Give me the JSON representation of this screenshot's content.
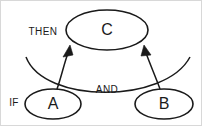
{
  "diagram": {
    "type": "rule-inference-diagram",
    "background_color": "#ffffff",
    "stroke_color": "#1a1a1a",
    "text_color": "#1a1a1a",
    "nodes": [
      {
        "id": "A",
        "label": "A",
        "cx": 53,
        "cy": 104,
        "rx": 28,
        "ry": 15
      },
      {
        "id": "B",
        "label": "B",
        "cx": 164,
        "cy": 104,
        "rx": 29,
        "ry": 15
      },
      {
        "id": "C",
        "label": "C",
        "cx": 107,
        "cy": 30,
        "rx": 42,
        "ry": 20
      }
    ],
    "edges": [
      {
        "id": "a-to-c",
        "from": "A",
        "to": "C",
        "arrow": true
      },
      {
        "id": "b-to-c",
        "from": "B",
        "to": "C",
        "arrow": true
      }
    ],
    "labels": [
      {
        "id": "if-label",
        "text": "IF",
        "x": 14,
        "y": 103
      },
      {
        "id": "then-label",
        "text": "THEN",
        "x": 43,
        "y": 32
      },
      {
        "id": "and-label",
        "text": "AND",
        "x": 107,
        "y": 90
      }
    ]
  }
}
